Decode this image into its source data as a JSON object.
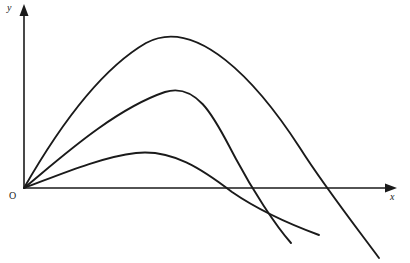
{
  "figure": {
    "kind": "projectile-trajectory-diagram",
    "background_color": "#ffffff",
    "stroke_color": "#1a1a1a",
    "width": 410,
    "height": 263
  },
  "axes": {
    "y_axis_label": "y",
    "x_axis_label": "x",
    "origin_label": "O",
    "origin": {
      "x": 24,
      "y": 188
    },
    "y_axis_top": {
      "x": 24,
      "y": 6
    },
    "x_axis_right": {
      "x": 396,
      "y": 188
    },
    "arrowheads": "both",
    "ticks": "none",
    "gridlines": "none"
  },
  "chart_data": {
    "type": "line",
    "title": "",
    "xlabel": "x",
    "ylabel": "y",
    "grid": false,
    "legend": "none",
    "xlim": [
      24,
      396
    ],
    "ylim": [
      263,
      6
    ],
    "note": "Three parabolic projectile trajectories launched from the common origin O at different angles; all descend and continue below the x-axis.",
    "series": [
      {
        "name": "steep-trajectory",
        "description": "Highest arc, launched at the steepest angle, peaks highest and travels farthest",
        "launch_point": {
          "x": 24,
          "y": 188
        },
        "apex": {
          "x": 146,
          "y": 43
        },
        "x_axis_crossing": {
          "x": 320,
          "y": 188
        },
        "end_point": {
          "x": 379,
          "y": 258
        },
        "path": "M 24 188 C 52 139, 96 72, 146 43 C 196 16, 256 80, 300 148 C 322 183, 356 227, 379 258"
      },
      {
        "name": "medium-trajectory",
        "description": "Middle arc, launched at an intermediate angle, moderate height and range",
        "launch_point": {
          "x": 24,
          "y": 188
        },
        "apex": {
          "x": 165,
          "y": 92
        },
        "x_axis_crossing": {
          "x": 233,
          "y": 188
        },
        "end_point": {
          "x": 291,
          "y": 243
        },
        "path": "M 24 188 C 56 162, 112 110, 165 92 C 200 81, 218 126, 236 159 C 252 189, 275 225, 291 243"
      },
      {
        "name": "shallow-trajectory",
        "description": "Lowest, flattest arc, launched at the shallowest angle, smallest peak height",
        "launch_point": {
          "x": 24,
          "y": 188
        },
        "apex": {
          "x": 136,
          "y": 153
        },
        "x_axis_crossing": {
          "x": 223,
          "y": 188
        },
        "end_point": {
          "x": 319,
          "y": 235
        },
        "path": "M 24 188 C 54 177, 100 157, 136 153 C 172 149, 202 169, 232 192 C 264 214, 300 228, 319 235"
      }
    ]
  }
}
